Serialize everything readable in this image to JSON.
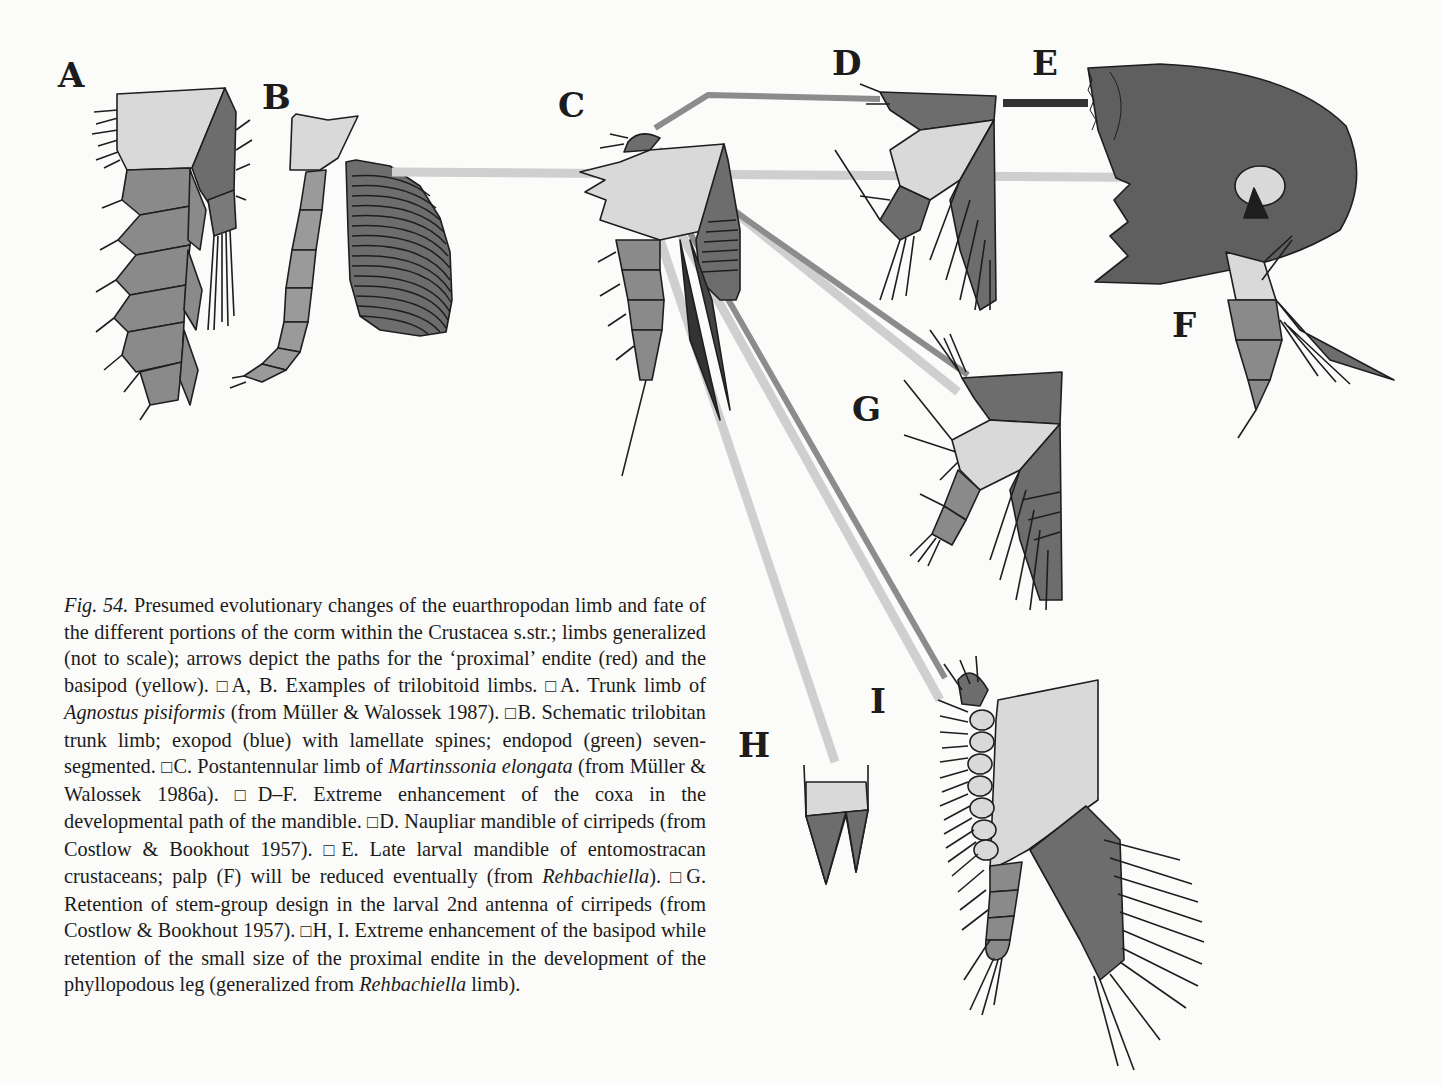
{
  "figure": {
    "panel_labels": {
      "A": "A",
      "B": "B",
      "C": "C",
      "D": "D",
      "E": "E",
      "F": "F",
      "G": "G",
      "H": "H",
      "I": "I"
    },
    "colors": {
      "background": "#fbfbfa",
      "basipod_light": "#d9d9d9",
      "endopod_mid": "#8a8a8a",
      "exopod_dark": "#6d6d6d",
      "coxa_dark": "#5f5f5f",
      "arrow_proximal_endite": "#8c8c8c",
      "arrow_basipod": "#cfcfcf",
      "arrow_dark": "#333333",
      "outline": "#1e1e1e"
    }
  },
  "caption": {
    "fig_number": "Fig. 54.",
    "intro": " Presumed evolutionary changes of the euarthropodan limb and fate of the different portions of the corm within the Crustacea s.str.; limbs generalized (not to scale); arrows depict the paths for the ‘proximal’ endite (red) and the basipod (yellow). ",
    "seg_AB": "A, B. Examples of trilobitoid limbs. ",
    "seg_A_pre": "A. Trunk limb of ",
    "seg_A_taxon": "Agnostus pisiformis",
    "seg_A_post": " (from Müller & Walossek 1987). ",
    "seg_B": "B. Schematic trilobitan trunk limb; exopod (blue) with lamellate spines; endopod (green) seven-segmented. ",
    "seg_C_pre": "C. Postantennular limb of ",
    "seg_C_taxon": "Martinssonia elongata",
    "seg_C_post": " (from Müller & Walossek 1986a). ",
    "seg_DF": "D–F. Extreme enhancement of the coxa in the developmental path of the mandible. ",
    "seg_D": "D. Naupliar mandible of cirripeds (from Costlow & Bookhout 1957). ",
    "seg_E_pre": "E. Late larval mandible of entomostracan crustaceans; palp (F) will be reduced eventually (from ",
    "seg_E_taxon": "Rehbachiella",
    "seg_E_post": "). ",
    "seg_G": "G. Retention of stem-group design in the larval 2nd antenna of cirripeds (from Costlow & Bookhout 1957). ",
    "seg_HI_pre": "H, I. Extreme enhancement of the basipod while retention of the small size of the proximal endite in the development of the phyllopodous leg (generalized from ",
    "seg_HI_taxon": "Rehbachiella",
    "seg_HI_post": " limb)."
  }
}
